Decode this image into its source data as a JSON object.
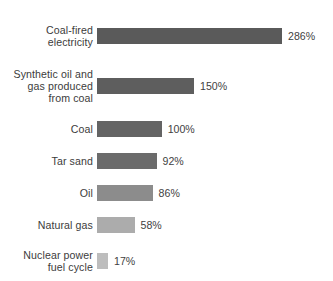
{
  "chart_data": {
    "type": "bar",
    "orientation": "horizontal",
    "title": "",
    "subtitle": "",
    "xlabel": "",
    "ylabel": "",
    "grid": false,
    "legend": false,
    "axis_visible": false,
    "value_suffix": "%",
    "xlim": [
      0,
      286
    ],
    "categories": [
      "Coal-fired\nelectricity",
      "Synthetic oil and\ngas produced\nfrom coal",
      "Coal",
      "Tar sand",
      "Oil",
      "Natural gas",
      "Nuclear power\nfuel cycle",
      "Geothermal"
    ],
    "values": [
      286,
      150,
      100,
      92,
      86,
      58,
      17,
      10
    ],
    "value_labels": [
      "286%",
      "150%",
      "100%",
      "92%",
      "86%",
      "58%",
      "17%",
      "10%"
    ],
    "bar_colors": [
      "#5a5a5a",
      "#5e5e5e",
      "#646464",
      "#6b6b6b",
      "#8c8c8c",
      "#acacac",
      "#bdbdbd",
      "#c8c8c8"
    ],
    "background_color": "#ffffff",
    "label_color": "#3c3c3c",
    "value_color": "#3f3f3f"
  }
}
